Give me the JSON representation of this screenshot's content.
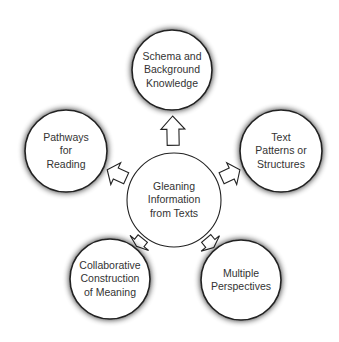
{
  "center": {
    "label": "Gleaning\nInformation\nfrom Texts",
    "cx": 174,
    "cy": 200,
    "r": 47
  },
  "nodes": [
    {
      "id": "schema",
      "label": "Schema and\nBackground\nKnowledge",
      "cx": 172,
      "cy": 70,
      "r": 40
    },
    {
      "id": "text-patterns",
      "label": "Text\nPatterns or\nStructures",
      "cx": 281,
      "cy": 151,
      "r": 41
    },
    {
      "id": "multiple-perspectives",
      "label": "Multiple\nPerspectives",
      "cx": 241,
      "cy": 280,
      "r": 40
    },
    {
      "id": "collaborative",
      "label": "Collaborative\nConstruction\nof Meaning",
      "cx": 110,
      "cy": 279,
      "r": 40
    },
    {
      "id": "pathways",
      "label": "Pathways\nfor\nReading",
      "cx": 66,
      "cy": 151,
      "r": 41
    }
  ],
  "colors": {
    "stroke": "#222222",
    "fill": "#ffffff",
    "text": "#333333",
    "shadow": "#000000"
  }
}
